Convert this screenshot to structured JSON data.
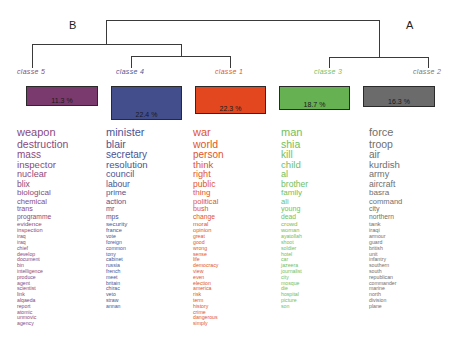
{
  "groups": {
    "left": "B",
    "right": "A"
  },
  "classes": [
    {
      "label": "classe 5",
      "percent": "11.3 %",
      "color": "#7b3a6e",
      "text_color": "#8a4a7d",
      "words": [
        "weapon",
        "destruction",
        "mass",
        "inspector",
        "nuclear",
        "blix",
        "biological",
        "chemical",
        "trans",
        "programme",
        "evidence",
        "inspection",
        "iraq",
        "iraq",
        "chief",
        "develop",
        "document",
        "bin",
        "intelligence",
        "produce",
        "agent",
        "scientist",
        "link",
        "alqaeda",
        "report",
        "atomic",
        "unmovic",
        "agency"
      ]
    },
    {
      "label": "classe 4",
      "percent": "22.4 %",
      "color": "#434f8c",
      "text_color": "#4a5593",
      "words": [
        "minister",
        "blair",
        "secretary",
        "resolution",
        "council",
        "labour",
        "prime",
        "action",
        "mr",
        "mps",
        "security",
        "france",
        "vote",
        "foreign",
        "common",
        "tony",
        "cabinet",
        "russia",
        "french",
        "meet",
        "britain",
        "chirac",
        "veto",
        "straw",
        "annan"
      ]
    },
    {
      "label": "classe 1",
      "percent": "22.3 %",
      "color": "#e2471f",
      "text_color": "#e0552b",
      "words": [
        "war",
        "world",
        "person",
        "think",
        "right",
        "public",
        "thing",
        "political",
        "bush",
        "change",
        "moral",
        "opinion",
        "great",
        "good",
        "wrong",
        "sense",
        "life",
        "democracy",
        "view",
        "even",
        "election",
        "america",
        "risk",
        "term",
        "history",
        "crime",
        "dangerous",
        "simply"
      ]
    },
    {
      "label": "classe 3",
      "percent": "18.7 %",
      "color": "#66b152",
      "text_color": "#72c05c",
      "words": [
        "man",
        "shia",
        "kill",
        "child",
        "al",
        "brother",
        "family",
        "ali",
        "young",
        "dead",
        "crowd",
        "woman",
        "ayatollah",
        "shoot",
        "soldier",
        "hotel",
        "car",
        "jazeera",
        "journalist",
        "city",
        "mosque",
        "die",
        "hospital",
        "picture",
        "son"
      ]
    },
    {
      "label": "classe 2",
      "percent": "16.3 %",
      "color": "#6b6b6b",
      "text_color": "#6f6f6f",
      "words": [
        "force",
        "troop",
        "air",
        "kurdish",
        "army",
        "aircraft",
        "basra",
        "command",
        "city",
        "northern",
        "tank",
        "iraqi",
        "armour",
        "guard",
        "british",
        "unit",
        "infantry",
        "southern",
        "south",
        "republican",
        "commander",
        "marine",
        "north",
        "division",
        "plane"
      ]
    }
  ]
}
